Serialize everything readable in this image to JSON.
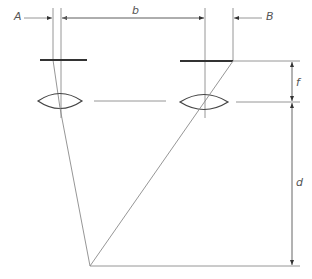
{
  "diagram": {
    "type": "optical-geometry",
    "labels": {
      "A": "A",
      "B": "B",
      "b": "b",
      "f": "f",
      "d": "d"
    },
    "colors": {
      "thin_line": "#8a8a8a",
      "thick_line": "#333333",
      "lens_stroke": "#444444",
      "label": "#555555"
    },
    "elements": {
      "lenses": [
        "left-lens",
        "right-lens"
      ],
      "image_planes": [
        "left-image-plane",
        "right-image-plane"
      ],
      "dimensions": [
        "A",
        "b",
        "B",
        "f",
        "d"
      ]
    }
  }
}
